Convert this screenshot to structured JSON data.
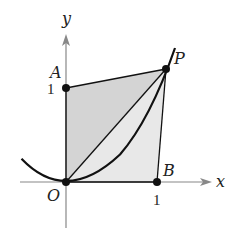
{
  "figure": {
    "axes": {
      "x_label": "x",
      "y_label": "y"
    },
    "ticks": {
      "x_tick": "1",
      "y_tick": "1"
    },
    "points": {
      "O": {
        "label": "O",
        "coords": [
          0,
          0
        ]
      },
      "A": {
        "label": "A",
        "coords": [
          0,
          1
        ]
      },
      "B": {
        "label": "B",
        "coords": [
          1,
          0
        ]
      },
      "P": {
        "label": "P",
        "coords": [
          1.1,
          1.21
        ]
      }
    },
    "curve": "y = x^2",
    "colors": {
      "line": "#111111",
      "axis": "#888888",
      "fill_dark": "#d4d4d4",
      "fill_light": "#e8e8e8"
    }
  }
}
